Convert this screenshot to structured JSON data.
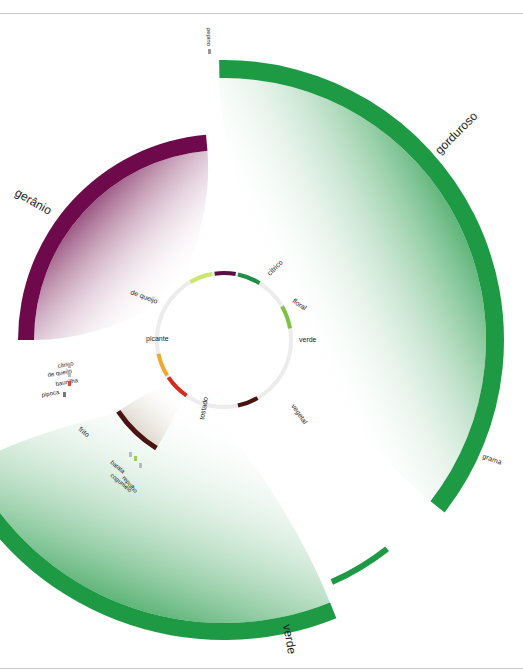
{
  "diagram": {
    "type": "radial-flavor-wheel",
    "center": [
      224,
      340
    ],
    "inner_radius": 67,
    "inner_ring_color": "#ececec",
    "inner_segments": [
      {
        "label": "cítrico",
        "start": -30,
        "end": -10,
        "color": "#c9e86a"
      },
      {
        "label": "floral",
        "start": -8,
        "end": 10,
        "color": "#5a0f43"
      },
      {
        "label": "verde",
        "start": 12,
        "end": 32,
        "color": "#1e8f44"
      },
      {
        "label": "vegetal",
        "start": 60,
        "end": 80,
        "color": "#7dc242"
      },
      {
        "label": "tostado",
        "start": 150,
        "end": 168,
        "color": "#4a1410"
      },
      {
        "label": "picante",
        "start": 214,
        "end": 236,
        "color": "#d9281c"
      },
      {
        "label": "de queijo",
        "start": 238,
        "end": 258,
        "color": "#f0a92c"
      }
    ],
    "inner_labels": [
      {
        "text": "cítrico",
        "x": 270,
        "y": 276,
        "rot": -45
      },
      {
        "text": "floral",
        "x": 292,
        "y": 302,
        "rot": 35
      },
      {
        "text": "verde",
        "x": 299,
        "y": 342,
        "rot": 0
      },
      {
        "text": "vegetal",
        "x": 291,
        "y": 406,
        "rot": 55
      },
      {
        "text": "tostado",
        "x": 204,
        "y": 420,
        "rot": -80
      },
      {
        "text": "picante",
        "x": 146,
        "y": 341,
        "rot": 0
      },
      {
        "text": "de queijo",
        "x": 130,
        "y": 294,
        "rot": 20
      }
    ],
    "outer_bands": [
      {
        "label": "gorduroso",
        "start": -1,
        "end": 128,
        "r_inner": 262,
        "r_outer": 280,
        "color": "#1e9a45",
        "fill_from": "#2a9c4c",
        "fill_to": "#ffffff"
      },
      {
        "label": "grama",
        "start": 142,
        "end": 156,
        "r_inner": 262,
        "r_outer": 268,
        "color": "#1e9a45",
        "fill_from": "#ffffff",
        "fill_to": "#ffffff"
      },
      {
        "label": "verde",
        "start": 158,
        "end": 244,
        "r_inner": 283,
        "r_outer": 300,
        "color": "#1e9a45",
        "fill_from": "#2a9c4c",
        "fill_to": "#ffffff"
      },
      {
        "label": "gerânio",
        "start": 270,
        "end": 355,
        "r_inner": 190,
        "r_outer": 206,
        "color": "#6e0a4c",
        "fill_from": "#7a1f58",
        "fill_to": "#ffffff"
      },
      {
        "label": "frito",
        "start": 212,
        "end": 236,
        "r_inner": 125,
        "r_outer": 130,
        "color": "#4a1410",
        "fill_from": "#d8cfc2",
        "fill_to": "#ffffff"
      }
    ],
    "outer_labels": [
      {
        "text": "gorduroso",
        "x": 440,
        "y": 155,
        "rot": -45,
        "size": 12
      },
      {
        "text": "verde",
        "x": 283,
        "y": 625,
        "rot": 80,
        "size": 12
      },
      {
        "text": "gerânio",
        "x": 14,
        "y": 195,
        "rot": 30,
        "size": 12
      },
      {
        "text": "grama",
        "x": 482,
        "y": 458,
        "rot": 20,
        "size": 7
      },
      {
        "text": "frito",
        "x": 78,
        "y": 430,
        "rot": 40,
        "size": 7
      }
    ],
    "small_markers": [
      {
        "text": "pepino",
        "x": 207,
        "y": 28,
        "rot": 90,
        "mark": [
          208,
          52
        ],
        "color": "#999999"
      },
      {
        "text": "cítrico",
        "x": 58,
        "y": 368,
        "rot": -10,
        "mark": [
          68,
          366
        ],
        "color": "#bbbbbb"
      },
      {
        "text": "de queijo",
        "x": 48,
        "y": 377,
        "rot": -10,
        "mark": [
          68,
          375
        ],
        "color": "#bbbbbb"
      },
      {
        "text": "baunilha",
        "x": 56,
        "y": 386,
        "rot": -10,
        "mark": [
          68,
          384
        ],
        "color": "#e3452f"
      },
      {
        "text": "pipoca",
        "x": 42,
        "y": 397,
        "rot": -10,
        "mark": [
          63,
          395
        ],
        "color": "#777777"
      },
      {
        "text": "batata",
        "x": 110,
        "y": 463,
        "rot": 40,
        "mark": [
          129,
          455
        ],
        "color": "#bbbbbb"
      },
      {
        "text": "cogumelo",
        "x": 110,
        "y": 476,
        "rot": 40,
        "mark": [
          134,
          459
        ],
        "color": "#9ccc5c"
      },
      {
        "text": "repolho",
        "x": 122,
        "y": 478,
        "rot": 50,
        "mark": [
          139,
          466
        ],
        "color": "#bbbbbb"
      }
    ]
  }
}
